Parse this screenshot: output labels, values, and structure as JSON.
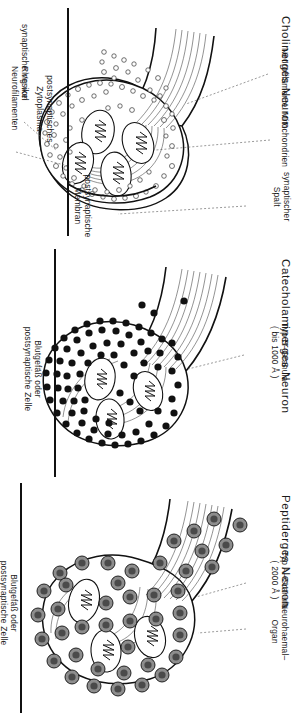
{
  "figure": {
    "orientation": "rotated-90-clockwise",
    "background": "#ffffff",
    "ink": "#111111"
  },
  "panels": [
    {
      "id": "cholinergic",
      "title": "Cholinerges Neuron",
      "labels": [
        {
          "name": "synaptic-vesicle",
          "text": "synaptische Vesikel"
        },
        {
          "name": "ring-of-neurofilaments",
          "line1": "Ring von",
          "line2": "Neurofilamenten"
        },
        {
          "name": "neurofilaments",
          "text": "Neurofilamente"
        },
        {
          "name": "mitochondria",
          "text": "Mitochondrien"
        },
        {
          "name": "synaptic-cleft",
          "line1": "synaptischer",
          "line2": "Spalt"
        }
      ],
      "captions": [
        {
          "name": "postsynaptic-membrane",
          "line1": "postsynaptische",
          "line2": "Membran"
        },
        {
          "name": "postsynaptic-cytoplasm",
          "line1": "postsynaptisches",
          "line2": "Zytoplasma"
        }
      ]
    },
    {
      "id": "catecholaminergic",
      "title": "Catecholaminerges Neuron",
      "labels": [
        {
          "name": "type-b-granule",
          "line1": "Typ B–Granula",
          "line2": "( bis 1000 Å )"
        }
      ],
      "captions": [
        {
          "name": "blood-vessel-or-postsynaptic-cell",
          "line1": "Blutgefäß oder",
          "line2": "postsynaptische Zelle"
        }
      ]
    },
    {
      "id": "peptidergic",
      "title": "Peptiderges Neuron",
      "labels": [
        {
          "name": "type-a-granule",
          "line1": "Typ A–Granula",
          "line2": "( 2000 Å )"
        },
        {
          "name": "neurohaemal-organ",
          "line1": "Neurohaemal–",
          "line2": "Organ"
        }
      ],
      "captions": [
        {
          "name": "blood-vessel-or-postsynaptic-cell",
          "line1": "Blutgefäß oder",
          "line2": "postsynaptische Zelle"
        }
      ]
    }
  ]
}
